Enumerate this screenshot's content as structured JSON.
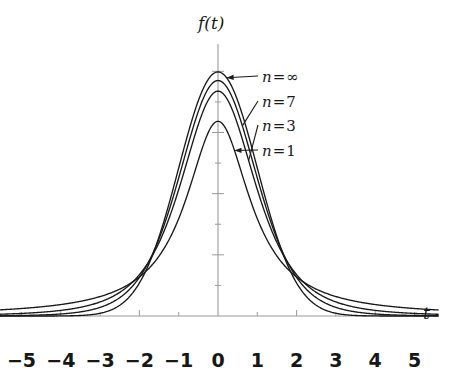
{
  "figure": {
    "background_color": "#ffffff",
    "curve_color": "#1a1a1a",
    "axis_color": "#9a9a9a",
    "text_color": "#1a1a1a"
  },
  "axes": {
    "x_axis_label": "t",
    "y_axis_label": "f(t)",
    "x_tick_labels": [
      "−5",
      "−4",
      "−3",
      "−2",
      "−1",
      "0",
      "1",
      "2",
      "3",
      "4",
      "5"
    ],
    "x_tick_values": [
      -5,
      -4,
      -3,
      -2,
      -1,
      0,
      1,
      2,
      3,
      4,
      5
    ],
    "y_tick_labels": [],
    "grid": false
  },
  "series_labels": [
    {
      "name": "n-infinity",
      "var": "n",
      "eq": "=",
      "val": "∞"
    },
    {
      "name": "n-7",
      "var": "n",
      "eq": "=",
      "val": "7"
    },
    {
      "name": "n-3",
      "var": "n",
      "eq": "=",
      "val": "3"
    },
    {
      "name": "n-1",
      "var": "n",
      "eq": "=",
      "val": "1"
    }
  ],
  "chart_data": {
    "type": "line",
    "title": "",
    "subtitle": "",
    "xlabel": "t",
    "ylabel": "f(t)",
    "xlim": [
      -5.6,
      5.6
    ],
    "ylim": [
      0,
      0.45
    ],
    "grid": false,
    "legend_position": "inline-annotations-right-of-peak",
    "x_ticks": [
      -5,
      -4,
      -3,
      -2,
      -1,
      0,
      1,
      2,
      3,
      4,
      5
    ],
    "y_ticks": [
      0,
      0.05,
      0.1,
      0.15,
      0.2,
      0.25,
      0.3,
      0.35,
      0.4
    ],
    "x": [
      -5.6,
      -5.2,
      -4.8,
      -4.4,
      -4.0,
      -3.6,
      -3.2,
      -2.8,
      -2.4,
      -2.0,
      -1.6,
      -1.2,
      -0.8,
      -0.4,
      0.0,
      0.4,
      0.8,
      1.2,
      1.6,
      2.0,
      2.4,
      2.8,
      3.2,
      3.6,
      4.0,
      4.4,
      4.8,
      5.2,
      5.6
    ],
    "series": [
      {
        "name": "n = ∞",
        "dof": "infinity",
        "peak": 0.3989,
        "values": [
          0.0,
          0.0,
          0.0,
          0.0001,
          0.0001,
          0.0006,
          0.0024,
          0.0079,
          0.0224,
          0.054,
          0.1109,
          0.1942,
          0.2897,
          0.3683,
          0.3989,
          0.3683,
          0.2897,
          0.1942,
          0.1109,
          0.054,
          0.0224,
          0.0079,
          0.0024,
          0.0006,
          0.0001,
          0.0001,
          0.0,
          0.0,
          0.0
        ]
      },
      {
        "name": "n = 7",
        "dof": 7,
        "peak": 0.3858,
        "values": [
          0.0009,
          0.0013,
          0.0019,
          0.0029,
          0.0045,
          0.0071,
          0.0115,
          0.019,
          0.032,
          0.054,
          0.0995,
          0.1771,
          0.274,
          0.3546,
          0.3858,
          0.3546,
          0.274,
          0.1771,
          0.0995,
          0.054,
          0.032,
          0.019,
          0.0115,
          0.0071,
          0.0045,
          0.0029,
          0.0019,
          0.0013,
          0.0009
        ]
      },
      {
        "name": "n = 3",
        "dof": 3,
        "peak": 0.3676,
        "values": [
          0.0032,
          0.0041,
          0.0053,
          0.007,
          0.0094,
          0.013,
          0.0184,
          0.0269,
          0.0404,
          0.0675,
          0.1098,
          0.179,
          0.2658,
          0.3375,
          0.3676,
          0.3375,
          0.2658,
          0.179,
          0.1098,
          0.0675,
          0.0404,
          0.0269,
          0.0184,
          0.013,
          0.0094,
          0.007,
          0.0053,
          0.0041,
          0.0032
        ]
      },
      {
        "name": "n = 1",
        "dof": 1,
        "peak": 0.3183,
        "values": [
          0.0095,
          0.011,
          0.0129,
          0.0153,
          0.0187,
          0.0232,
          0.0294,
          0.0379,
          0.0494,
          0.0637,
          0.0874,
          0.1303,
          0.1941,
          0.2744,
          0.3183,
          0.2744,
          0.1941,
          0.1303,
          0.0874,
          0.0637,
          0.0494,
          0.0379,
          0.0294,
          0.0232,
          0.0187,
          0.0153,
          0.0129,
          0.011,
          0.0095
        ]
      }
    ],
    "annotations": [
      {
        "text": "n = ∞",
        "points_to_series": "n = ∞"
      },
      {
        "text": "n = 7",
        "points_to_series": "n = 7"
      },
      {
        "text": "n = 3",
        "points_to_series": "n = 3"
      },
      {
        "text": "n = 1",
        "points_to_series": "n = 1"
      }
    ]
  }
}
